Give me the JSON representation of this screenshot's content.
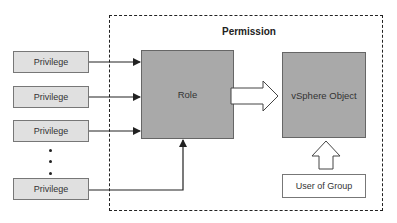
{
  "diagram": {
    "container": {
      "label": "Permission",
      "style": "dashed"
    },
    "privileges": [
      {
        "label": "Privilege"
      },
      {
        "label": "Privilege"
      },
      {
        "label": "Privilege"
      },
      {
        "label": "Privilege"
      }
    ],
    "ellipsis": "vertical-dots",
    "role": {
      "label": "Role"
    },
    "object": {
      "label": "vSphere Object"
    },
    "principal": {
      "label": "User of Group"
    },
    "edges": [
      {
        "from": "privilege-1",
        "to": "role",
        "type": "arrow"
      },
      {
        "from": "privilege-2",
        "to": "role",
        "type": "arrow"
      },
      {
        "from": "privilege-3",
        "to": "role",
        "type": "arrow"
      },
      {
        "from": "privilege-4",
        "to": "role",
        "type": "elbow-arrow"
      },
      {
        "from": "role",
        "to": "vsphere-object",
        "type": "hollow-block-arrow"
      },
      {
        "from": "user-of-group",
        "to": "vsphere-object",
        "type": "hollow-block-arrow"
      }
    ],
    "colors": {
      "privilege_fill": "#e0e0e0",
      "node_fill": "#a9a9a9",
      "principal_fill": "#ffffff",
      "line": "#222222"
    }
  }
}
